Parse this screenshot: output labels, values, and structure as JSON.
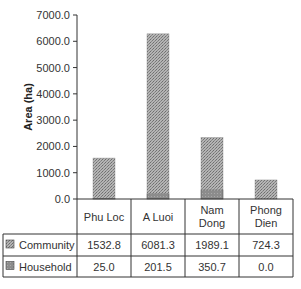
{
  "chart_data": {
    "type": "bar",
    "stacked": true,
    "title": "",
    "xlabel": "",
    "ylabel": "Area (ha)",
    "ylim": [
      0,
      7000
    ],
    "yticks": [
      "0.0",
      "1000.0",
      "2000.0",
      "3000.0",
      "4000.0",
      "5000.0",
      "6000.0",
      "7000.0"
    ],
    "ytick_values": [
      0,
      1000,
      2000,
      3000,
      4000,
      5000,
      6000,
      7000
    ],
    "grid": false,
    "legend_placement": "data-table-left",
    "categories": [
      [
        "Phu Loc"
      ],
      [
        "A Luoi"
      ],
      [
        "Nam",
        "Dong"
      ],
      [
        "Phong",
        "Dien"
      ]
    ],
    "series": [
      {
        "name": "Household",
        "values": [
          25.0,
          201.5,
          350.7,
          0.0
        ],
        "labels": [
          "25.0",
          "201.5",
          "350.7",
          "0.0"
        ],
        "color": "#8c8c8c"
      },
      {
        "name": "Community",
        "values": [
          1532.8,
          6081.3,
          1989.1,
          724.3
        ],
        "labels": [
          "1532.8",
          "6081.3",
          "1989.1",
          "724.3"
        ],
        "color": "#a3a3a3"
      }
    ],
    "table_rows": [
      "Community",
      "Household"
    ]
  }
}
